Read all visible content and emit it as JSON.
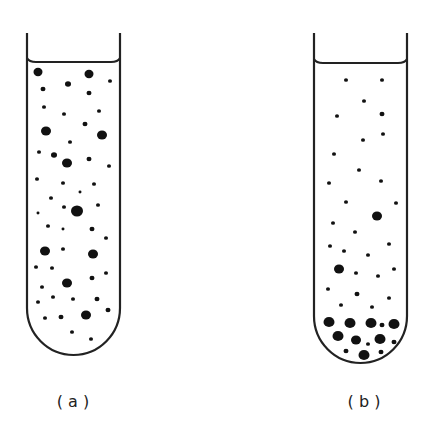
{
  "figure": {
    "stroke_color": "#222222",
    "particle_color": "#111111",
    "background": "#ffffff"
  },
  "tubes": [
    {
      "id": "a",
      "label": "( a )",
      "label_pos": [
        73,
        407
      ],
      "left": 27,
      "right": 120,
      "top": 33,
      "meniscus_y": 62,
      "curve_start": 308,
      "bottom": 355,
      "state": "uniformly dispersed particles",
      "particles": [
        [
          38,
          72,
          4.5
        ],
        [
          89,
          74,
          4.5
        ],
        [
          110,
          81,
          2
        ],
        [
          43,
          89,
          2.5
        ],
        [
          68,
          84,
          3
        ],
        [
          89,
          93,
          2.5
        ],
        [
          44,
          107,
          2
        ],
        [
          64,
          114,
          2
        ],
        [
          99,
          111,
          2
        ],
        [
          46,
          131,
          5
        ],
        [
          85,
          124,
          2.5
        ],
        [
          102,
          135,
          5
        ],
        [
          70,
          142,
          2
        ],
        [
          39,
          152,
          2
        ],
        [
          54,
          155,
          3
        ],
        [
          67,
          163,
          5
        ],
        [
          89,
          159,
          2.5
        ],
        [
          109,
          166,
          2
        ],
        [
          37,
          179,
          2
        ],
        [
          63,
          183,
          2
        ],
        [
          94,
          184,
          2
        ],
        [
          80,
          192,
          1.5
        ],
        [
          51,
          198,
          2
        ],
        [
          64,
          207,
          2
        ],
        [
          98,
          205,
          2
        ],
        [
          77,
          211,
          6
        ],
        [
          38,
          213,
          1.5
        ],
        [
          48,
          226,
          2
        ],
        [
          63,
          229,
          1.5
        ],
        [
          92,
          229,
          2.5
        ],
        [
          106,
          238,
          2
        ],
        [
          45,
          251,
          5
        ],
        [
          63,
          249,
          2
        ],
        [
          93,
          254,
          5
        ],
        [
          36,
          267,
          2
        ],
        [
          52,
          268,
          2
        ],
        [
          106,
          273,
          2
        ],
        [
          67,
          283,
          5
        ],
        [
          92,
          278,
          2.5
        ],
        [
          42,
          287,
          2
        ],
        [
          53,
          297,
          2
        ],
        [
          38,
          302,
          2
        ],
        [
          73,
          299,
          2
        ],
        [
          97,
          299,
          2.5
        ],
        [
          108,
          310,
          2.5
        ],
        [
          45,
          318,
          2
        ],
        [
          61,
          317,
          2.5
        ],
        [
          86,
          315,
          5
        ],
        [
          72,
          332,
          2
        ],
        [
          91,
          339,
          2
        ]
      ]
    },
    {
      "id": "b",
      "label": "( b )",
      "label_pos": [
        364,
        407
      ],
      "left": 314,
      "right": 407,
      "top": 33,
      "meniscus_y": 63,
      "curve_start": 316,
      "bottom": 363,
      "state": "large particles sedimented at bottom",
      "particles": [
        [
          346,
          80,
          2
        ],
        [
          382,
          80,
          2
        ],
        [
          364,
          101,
          2
        ],
        [
          337,
          116,
          2
        ],
        [
          382,
          114,
          2.5
        ],
        [
          363,
          140,
          2
        ],
        [
          383,
          134,
          2
        ],
        [
          334,
          154,
          2
        ],
        [
          359,
          170,
          2
        ],
        [
          329,
          183,
          2
        ],
        [
          381,
          181,
          2
        ],
        [
          346,
          202,
          2
        ],
        [
          396,
          203,
          2
        ],
        [
          377,
          216,
          5
        ],
        [
          333,
          223,
          2
        ],
        [
          355,
          232,
          2
        ],
        [
          330,
          246,
          2
        ],
        [
          344,
          251,
          2
        ],
        [
          368,
          255,
          2
        ],
        [
          389,
          244,
          2
        ],
        [
          339,
          269,
          5
        ],
        [
          356,
          273,
          2
        ],
        [
          378,
          276,
          2
        ],
        [
          394,
          269,
          2
        ],
        [
          328,
          289,
          2
        ],
        [
          357,
          294,
          2.5
        ],
        [
          389,
          298,
          2
        ],
        [
          341,
          305,
          2
        ],
        [
          372,
          307,
          2
        ],
        [
          329,
          322,
          5.5
        ],
        [
          350,
          323,
          5.5
        ],
        [
          371,
          323,
          5.5
        ],
        [
          382,
          325,
          2.5
        ],
        [
          394,
          324,
          5.5
        ],
        [
          338,
          336,
          5.5
        ],
        [
          356,
          340,
          5
        ],
        [
          368,
          344,
          2
        ],
        [
          380,
          339,
          5.5
        ],
        [
          394,
          342,
          2.5
        ],
        [
          346,
          351,
          2.5
        ],
        [
          364,
          355,
          5.5
        ],
        [
          381,
          352,
          2.5
        ]
      ]
    }
  ]
}
